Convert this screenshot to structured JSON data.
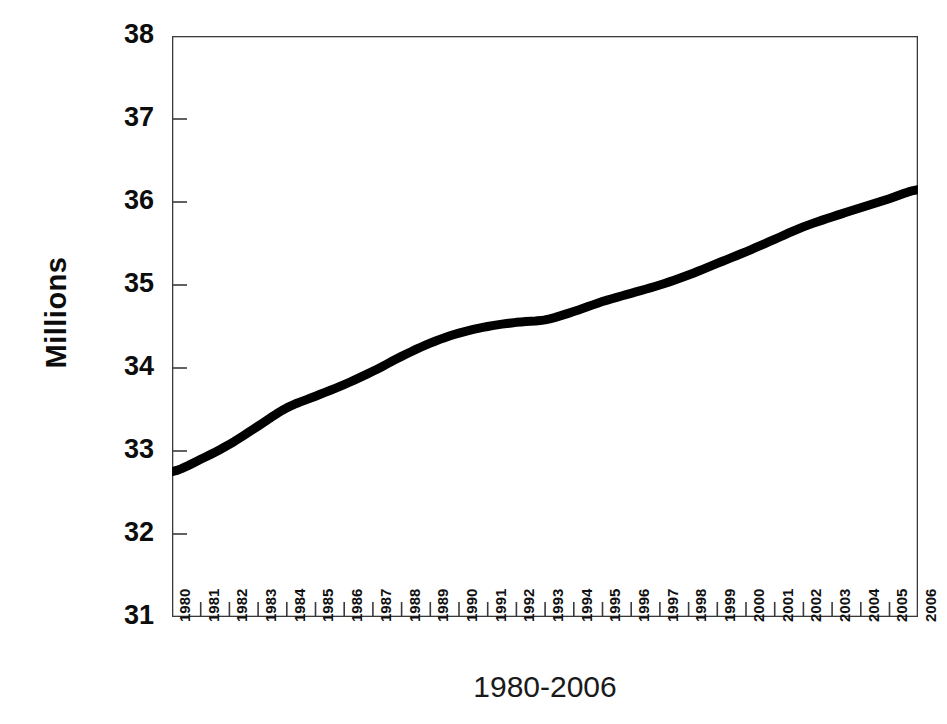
{
  "chart_data": {
    "type": "line",
    "title": "",
    "xlabel": "1980-2006",
    "ylabel": "Millions",
    "ylim": [
      31,
      38
    ],
    "xlim": [
      1980,
      2006
    ],
    "grid": false,
    "legend": null,
    "yticks": [
      "31",
      "32",
      "33",
      "34",
      "35",
      "36",
      "37",
      "38"
    ],
    "ytick_values": [
      31,
      32,
      33,
      34,
      35,
      36,
      37,
      38
    ],
    "categories": [
      "1980",
      "1981",
      "1982",
      "1983",
      "1984",
      "1985",
      "1986",
      "1987",
      "1988",
      "1989",
      "1990",
      "1991",
      "1992",
      "1993",
      "1994",
      "1995",
      "1996",
      "1997",
      "1998",
      "1999",
      "2000",
      "2001",
      "2002",
      "2003",
      "2004",
      "2005",
      "2006"
    ],
    "x": [
      1980,
      1981,
      1982,
      1983,
      1984,
      1985,
      1986,
      1987,
      1988,
      1989,
      1990,
      1991,
      1992,
      1993,
      1994,
      1995,
      1996,
      1997,
      1998,
      1999,
      2000,
      2001,
      2002,
      2003,
      2004,
      2005,
      2006
    ],
    "values": [
      32.75,
      32.9,
      33.08,
      33.3,
      33.52,
      33.66,
      33.8,
      33.96,
      34.14,
      34.3,
      34.42,
      34.5,
      34.55,
      34.58,
      34.68,
      34.8,
      34.9,
      35.0,
      35.12,
      35.26,
      35.4,
      35.55,
      35.7,
      35.82,
      35.93,
      36.04,
      36.15
    ],
    "series": [
      {
        "name": "Millions",
        "color": "#000000",
        "line_width": 9,
        "values": [
          32.75,
          32.9,
          33.08,
          33.3,
          33.52,
          33.66,
          33.8,
          33.96,
          34.14,
          34.3,
          34.42,
          34.5,
          34.55,
          34.58,
          34.68,
          34.8,
          34.9,
          35.0,
          35.12,
          35.26,
          35.4,
          35.55,
          35.7,
          35.82,
          35.93,
          36.04,
          36.15
        ]
      }
    ]
  },
  "figure": {
    "background_color": "#ffffff",
    "axis_color": "#3a3a3a",
    "text_color": "#111111",
    "line_color": "#000000"
  }
}
